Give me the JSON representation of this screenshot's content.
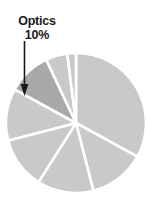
{
  "figure": {
    "name": "pie-chart-optics",
    "background": "#ffffff"
  },
  "annotation": {
    "label": "Optics",
    "value": "10%",
    "target_slice": "Optics",
    "leader_icon": "down-arrow-icon",
    "text_color": "#1a1a1a"
  },
  "colors": {
    "slice_default": "#c9c9c9",
    "slice_highlight": "#a9a9a9",
    "slice_edge": "#ffffff",
    "arrow": "#1a1a1a"
  },
  "chart_data": {
    "type": "pie",
    "title": "",
    "subtitle": "",
    "xlabel": "",
    "ylabel": "",
    "grid": false,
    "legend": "none",
    "units": "percent",
    "start_angle_deg": -90,
    "direction": "clockwise",
    "center_px": [
      76,
      123
    ],
    "radius_px": 70,
    "labels": [
      "Segment 1",
      "Segment 2",
      "Segment 3",
      "Segment 4",
      "Segment 5",
      "Optics",
      "Segment 7",
      "Segment 8"
    ],
    "values": [
      33,
      13,
      13,
      12,
      12,
      10,
      5,
      2
    ],
    "highlight_index": 5,
    "annotations": [
      {
        "text": "Optics",
        "value": "10%",
        "points_to": "Optics"
      }
    ]
  }
}
